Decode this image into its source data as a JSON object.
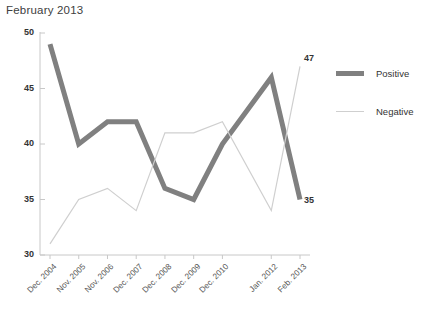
{
  "title": "February 2013",
  "legend": {
    "position": "right",
    "items": [
      {
        "label": "Positive",
        "color": "#808080",
        "width": 5
      },
      {
        "label": "Negative",
        "color": "#cfcfcf",
        "width": 1.2
      }
    ]
  },
  "axis": {
    "y_ticks": [
      "30",
      "35",
      "40",
      "45",
      "50"
    ],
    "x_ticks": [
      "Dec. 2004",
      "Nov. 2005",
      "Nov. 2006",
      "Dec. 2007",
      "Dec. 2008",
      "Dec. 2009",
      "Dec. 2010",
      "Jan. 2012",
      "Feb. 2013"
    ]
  },
  "labels": {
    "positive_end": "35",
    "negative_end": "47"
  },
  "chart_data": {
    "type": "line",
    "title": "February 2013",
    "xlabel": "",
    "ylabel": "",
    "ylim": [
      30,
      50
    ],
    "yticks": [
      30,
      35,
      40,
      45,
      50
    ],
    "grid": false,
    "legend_position": "right",
    "categories": [
      "Dec. 2004",
      "Nov. 2005",
      "Nov. 2006",
      "Dec. 2007",
      "Dec. 2008",
      "Dec. 2009",
      "Dec. 2010",
      "Jan. 2012",
      "Feb. 2013"
    ],
    "series": [
      {
        "name": "Positive",
        "color": "#808080",
        "linewidth": 5,
        "values": [
          49,
          40,
          42,
          42,
          36,
          35,
          40,
          46,
          35
        ],
        "end_label": "35"
      },
      {
        "name": "Negative",
        "color": "#cfcfcf",
        "linewidth": 1.2,
        "values": [
          31,
          35,
          36,
          34,
          41,
          41,
          42,
          34,
          47
        ],
        "end_label": "47"
      }
    ]
  }
}
